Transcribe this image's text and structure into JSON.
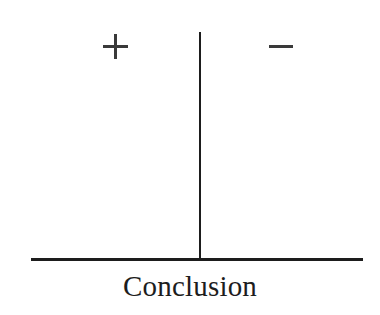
{
  "figure": {
    "caption": "Conclusion",
    "background_color": "#ffffff",
    "line_color": "#1d1d1d",
    "glyph_color": "#3a3a3a"
  },
  "axis": {
    "vertical": {
      "label": "vertical-divider",
      "x": 200,
      "y_top": 32,
      "y_bottom": 259,
      "thickness": 2
    },
    "horizontal": {
      "label": "baseline-axis",
      "y": 258,
      "x_start": 31,
      "x_end": 363,
      "thickness": 2.6
    }
  },
  "markers": [
    {
      "name": "positive-sign",
      "symbol": "+",
      "side": "left",
      "center_x": 115,
      "center_y": 46
    },
    {
      "name": "negative-sign",
      "symbol": "−",
      "side": "right",
      "center_x": 281,
      "center_y": 46
    }
  ],
  "chart_data": {
    "type": "scatter",
    "title": "",
    "xlabel": "Conclusion",
    "ylabel": "",
    "categories": [
      "+",
      "−"
    ],
    "values": [
      0,
      0
    ],
    "annotations": [
      {
        "text": "+",
        "x": 115,
        "y": 46
      },
      {
        "text": "−",
        "x": 281,
        "y": 46
      },
      {
        "text": "Conclusion",
        "x": 196,
        "y": 291
      }
    ],
    "grid": false,
    "legend": "none"
  }
}
